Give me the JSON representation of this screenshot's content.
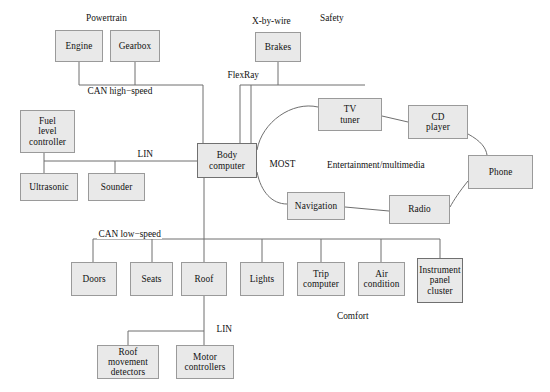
{
  "diagram": {
    "type": "network-topology-diagram",
    "box_fill_color": "#e9e9e9",
    "box_border_color": "#9a9a9a",
    "wire_color": "#6f6f6f",
    "domain_labels": [
      {
        "name": "powertrain",
        "text": "Powertrain",
        "x": 86,
        "y": 13
      },
      {
        "name": "x-by-wire",
        "text": "X-by-wire",
        "x": 252,
        "y": 16
      },
      {
        "name": "safety",
        "text": "Safety",
        "x": 320,
        "y": 13
      },
      {
        "name": "entertainment-multimedia",
        "text": "Entertainment/multimedia",
        "x": 327,
        "y": 160
      },
      {
        "name": "comfort",
        "text": "Comfort",
        "x": 337,
        "y": 311
      }
    ],
    "bus_labels": [
      {
        "name": "can-high-speed",
        "text": "CAN high−speed",
        "x": 86,
        "y": 86
      },
      {
        "name": "flexray",
        "text": "FlexRay",
        "x": 226,
        "y": 70
      },
      {
        "name": "lin-front",
        "text": "LIN",
        "x": 136,
        "y": 149
      },
      {
        "name": "most",
        "text": "MOST",
        "x": 268,
        "y": 159
      },
      {
        "name": "can-low-speed",
        "text": "CAN low−speed",
        "x": 97,
        "y": 229
      },
      {
        "name": "lin-roof",
        "text": "LIN",
        "x": 215,
        "y": 324
      }
    ],
    "nodes": [
      {
        "name": "engine",
        "label": "Engine",
        "x": 55,
        "y": 30,
        "w": 48,
        "h": 32,
        "thick": false
      },
      {
        "name": "gearbox",
        "label": "Gearbox",
        "x": 110,
        "y": 30,
        "w": 50,
        "h": 32,
        "thick": false
      },
      {
        "name": "brakes",
        "label": "Brakes",
        "x": 255,
        "y": 32,
        "w": 46,
        "h": 30,
        "thick": false
      },
      {
        "name": "fuel-level-controller",
        "label": "Fuel\nlevel\ncontroller",
        "x": 20,
        "y": 110,
        "w": 55,
        "h": 43,
        "thick": false
      },
      {
        "name": "ultrasonic",
        "label": "Ultrasonic",
        "x": 20,
        "y": 173,
        "w": 58,
        "h": 28,
        "thick": false
      },
      {
        "name": "sounder",
        "label": "Sounder",
        "x": 88,
        "y": 173,
        "w": 57,
        "h": 28,
        "thick": false
      },
      {
        "name": "body-computer",
        "label": "Body\ncomputer",
        "x": 197,
        "y": 143,
        "w": 60,
        "h": 35,
        "thick": true
      },
      {
        "name": "tv-tuner",
        "label": "TV\ntuner",
        "x": 318,
        "y": 98,
        "w": 64,
        "h": 33,
        "thick": false
      },
      {
        "name": "cd-player",
        "label": "CD\nplayer",
        "x": 408,
        "y": 105,
        "w": 60,
        "h": 34,
        "thick": false
      },
      {
        "name": "phone",
        "label": "Phone",
        "x": 468,
        "y": 155,
        "w": 65,
        "h": 34,
        "thick": false
      },
      {
        "name": "radio",
        "label": "Radio",
        "x": 389,
        "y": 195,
        "w": 61,
        "h": 29,
        "thick": false
      },
      {
        "name": "navigation",
        "label": "Navigation",
        "x": 287,
        "y": 192,
        "w": 58,
        "h": 28,
        "thick": false
      },
      {
        "name": "doors",
        "label": "Doors",
        "x": 71,
        "y": 262,
        "w": 46,
        "h": 34,
        "thick": false
      },
      {
        "name": "seats",
        "label": "Seats",
        "x": 130,
        "y": 262,
        "w": 43,
        "h": 34,
        "thick": false
      },
      {
        "name": "roof",
        "label": "Roof",
        "x": 181,
        "y": 262,
        "w": 46,
        "h": 34,
        "thick": false
      },
      {
        "name": "lights",
        "label": "Lights",
        "x": 240,
        "y": 262,
        "w": 44,
        "h": 34,
        "thick": false
      },
      {
        "name": "trip-computer",
        "label": "Trip\ncomputer",
        "x": 297,
        "y": 262,
        "w": 48,
        "h": 34,
        "thick": false
      },
      {
        "name": "air-condition",
        "label": "Air\ncondition",
        "x": 358,
        "y": 262,
        "w": 47,
        "h": 34,
        "thick": false
      },
      {
        "name": "instrument-panel-cluster",
        "label": "Instrument\npanel\ncluster",
        "x": 417,
        "y": 258,
        "w": 46,
        "h": 45,
        "thick": true
      },
      {
        "name": "roof-movement-detectors",
        "label": "Roof\nmovement\ndetectors",
        "x": 97,
        "y": 345,
        "w": 62,
        "h": 34,
        "thick": false
      },
      {
        "name": "motor-controllers",
        "label": "Motor\ncontrollers",
        "x": 176,
        "y": 345,
        "w": 58,
        "h": 34,
        "thick": false
      }
    ],
    "buses": [
      {
        "name": "can-high-speed-bus",
        "protocol": "CAN high-speed",
        "members": [
          "engine",
          "gearbox",
          "body-computer"
        ]
      },
      {
        "name": "flexray-bus",
        "protocol": "FlexRay",
        "members": [
          "brakes",
          "body-computer"
        ]
      },
      {
        "name": "lin-front-bus",
        "protocol": "LIN",
        "members": [
          "fuel-level-controller",
          "ultrasonic",
          "sounder",
          "body-computer"
        ]
      },
      {
        "name": "most-ring",
        "protocol": "MOST",
        "members": [
          "body-computer",
          "tv-tuner",
          "cd-player",
          "phone",
          "radio",
          "navigation"
        ]
      },
      {
        "name": "can-low-speed-bus",
        "protocol": "CAN low-speed",
        "members": [
          "body-computer",
          "doors",
          "seats",
          "roof",
          "lights",
          "trip-computer",
          "air-condition",
          "instrument-panel-cluster"
        ]
      },
      {
        "name": "lin-roof-bus",
        "protocol": "LIN",
        "members": [
          "roof",
          "roof-movement-detectors",
          "motor-controllers"
        ]
      }
    ]
  }
}
